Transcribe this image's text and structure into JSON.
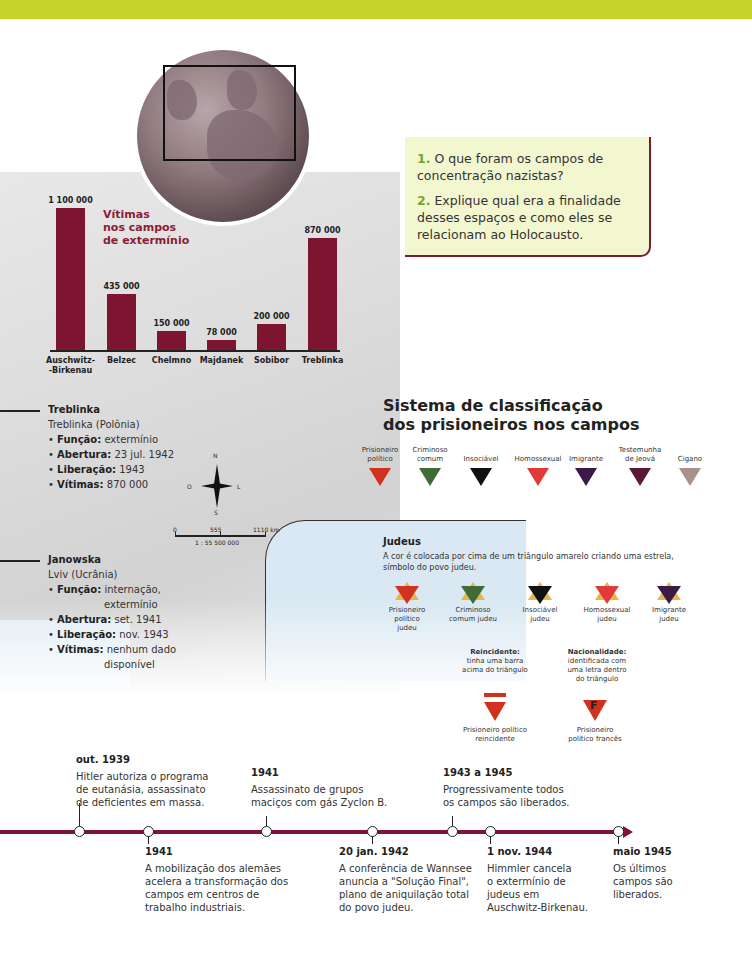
{
  "colors": {
    "top_band": "#c5d32a",
    "bar": "#7d1530",
    "chart_title": "#8a1d35",
    "question_number": "#6fa82a",
    "question_box": "#f3f7cf",
    "timeline": "#7d1530"
  },
  "questions": [
    {
      "number": "1.",
      "text": "O que foram os campos de concentração nazistas?"
    },
    {
      "number": "2.",
      "text": "Explique qual era a finalidade desses espaços e como eles se relacionam ao Holocausto."
    }
  ],
  "chart_data": {
    "type": "bar",
    "title": "Vítimas nos campos de extermínio",
    "categories": [
      "Auschwitz-Birkenau",
      "Belzec",
      "Chelmno",
      "Majdanek",
      "Sobibor",
      "Treblinka"
    ],
    "values": [
      1100000,
      435000,
      150000,
      78000,
      200000,
      870000
    ],
    "value_labels": [
      "1 100 000",
      "435 000",
      "150 000",
      "78 000",
      "200 000",
      "870 000"
    ],
    "xlabel": "",
    "ylabel": "",
    "ylim": [
      0,
      1100000
    ],
    "grid": false,
    "legend": null
  },
  "chart": {
    "title_lines": [
      "Vítimas",
      "nos campos",
      "de extermínio"
    ],
    "cat_lines": [
      [
        "Auschwitz-",
        "-Birkenau"
      ],
      [
        "Belzec"
      ],
      [
        "Chelmno"
      ],
      [
        "Majdanek"
      ],
      [
        "Sobibor"
      ],
      [
        "Treblinka"
      ]
    ]
  },
  "camps": [
    {
      "name": "Treblinka",
      "location": "Treblinka (Polônia)",
      "funcao_label": "Função:",
      "funcao": "extermínio",
      "abertura_label": "Abertura:",
      "abertura": "23 jul. 1942",
      "liberacao_label": "Liberação:",
      "liberacao": "1943",
      "vitimas_label": "Vítimas:",
      "vitimas": "870 000"
    },
    {
      "name": "Janowska",
      "location": "Lviv (Ucrânia)",
      "funcao_label": "Função:",
      "funcao": "internação,",
      "funcao2": "extermínio",
      "abertura_label": "Abertura:",
      "abertura": "set. 1941",
      "liberacao_label": "Liberação:",
      "liberacao": "nov. 1943",
      "vitimas_label": "Vítimas:",
      "vitimas": "nenhum dado",
      "vitimas2": "disponível"
    }
  ],
  "map": {
    "compass": {
      "n": "N",
      "s": "S",
      "l": "L",
      "o": "O"
    },
    "scale": {
      "zero": "0",
      "mid": "555",
      "end": "1110 km",
      "ratio": "1 : 55 500 000"
    }
  },
  "classification": {
    "title_line1": "Sistema de classificação",
    "title_line2": "dos prisioneiros nos campos",
    "triangles": [
      {
        "label1": "Prisioneiro",
        "label2": "político",
        "color": "#d1311f"
      },
      {
        "label1": "Criminoso",
        "label2": "comum",
        "color": "#3f6b37"
      },
      {
        "label1": "",
        "label2": "Insociável",
        "color": "#111111"
      },
      {
        "label1": "",
        "label2": "Homossexual",
        "color": "#e03a3a"
      },
      {
        "label1": "",
        "label2": "Imigrante",
        "color": "#3b1a45"
      },
      {
        "label1": "Testemunha",
        "label2": "de Jeová",
        "color": "#5a1a35"
      },
      {
        "label1": "",
        "label2": "Cigano",
        "color": "#a89287"
      }
    ],
    "jews_title": "Judeus",
    "jews_desc": "A cor é colocada por cima de um triângulo amarelo criando uma estrela, símbolo do povo judeu.",
    "stars": [
      {
        "lines": [
          "Prisioneiro",
          "político",
          "judeu"
        ],
        "color": "#d1311f"
      },
      {
        "lines": [
          "Criminoso",
          "comum judeu"
        ],
        "color": "#3f6b37"
      },
      {
        "lines": [
          "Insociável",
          "judeu"
        ],
        "color": "#111111"
      },
      {
        "lines": [
          "Homossexual",
          "judeu"
        ],
        "color": "#e03a3a"
      },
      {
        "lines": [
          "Imigrante",
          "judeu"
        ],
        "color": "#3b1a45"
      }
    ],
    "reincidente": {
      "title": "Reincidente:",
      "desc": [
        "tinha uma barra",
        "acima do triângulo"
      ],
      "caption": [
        "Prisioneiro político",
        "reincidente"
      ]
    },
    "nacionalidade": {
      "title": "Nacionalidade:",
      "desc": [
        "identificada com",
        "uma letra dentro",
        "do triângulo"
      ],
      "letter": "F",
      "caption": [
        "Prisioneiro",
        "político francês"
      ]
    }
  },
  "timeline": {
    "above": [
      {
        "date": "out. 1939",
        "lines": [
          "Hitler autoriza o programa",
          "de eutanásia, assassinato",
          "de deficientes em massa."
        ]
      },
      {
        "date": "1941",
        "lines": [
          "Assassinato de grupos",
          "maciços com gás Zyclon B."
        ]
      },
      {
        "date": "1943 a 1945",
        "lines": [
          "Progressivamente todos",
          "os campos são liberados."
        ]
      }
    ],
    "below": [
      {
        "date": "1941",
        "lines": [
          "A mobilização dos alemães",
          "acelera a transformação dos",
          "campos em centros de",
          "trabalho industriais."
        ]
      },
      {
        "date": "20 jan. 1942",
        "lines": [
          "A conferência de Wannsee",
          "anuncia a \"Solução Final\",",
          "plano de aniquilação total",
          "do povo judeu."
        ]
      },
      {
        "date": "1 nov. 1944",
        "lines": [
          "Himmler cancela",
          "o extermínio de",
          "judeus em",
          "Auschwitz-Birkenau."
        ]
      },
      {
        "date": "maio 1945",
        "lines": [
          "Os últimos",
          "campos são",
          "liberados."
        ]
      }
    ]
  }
}
